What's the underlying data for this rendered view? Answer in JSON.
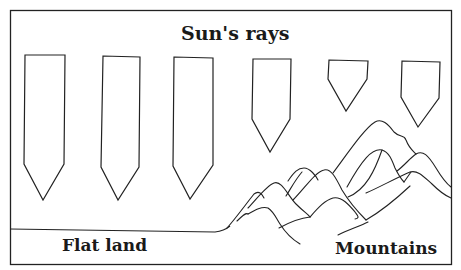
{
  "diagram": {
    "title": "Sun's rays",
    "labels": {
      "flat_land": "Flat land",
      "mountains": "Mountains"
    },
    "stroke_color": "#222222",
    "background_color": "#ffffff",
    "rays": [
      {
        "id": 1,
        "over": "flat land",
        "length": "long"
      },
      {
        "id": 2,
        "over": "flat land",
        "length": "long"
      },
      {
        "id": 3,
        "over": "flat land",
        "length": "long"
      },
      {
        "id": 4,
        "over": "mountains",
        "length": "medium"
      },
      {
        "id": 5,
        "over": "mountains",
        "length": "short"
      },
      {
        "id": 6,
        "over": "mountains",
        "length": "short"
      }
    ]
  }
}
